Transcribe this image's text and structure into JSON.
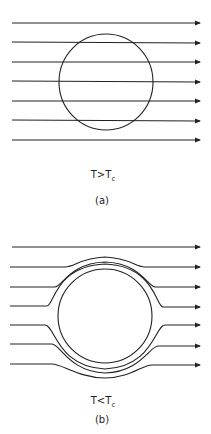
{
  "panel_a": {
    "condition_main": "T>T",
    "condition_sub": "c",
    "caption": "(a)",
    "description": "Uniform field lines passing straight through the sphere"
  },
  "panel_b": {
    "condition_main": "T<T",
    "condition_sub": "c",
    "caption": "(b)",
    "description": "Field lines expelled from the sphere (Meissner effect)"
  },
  "colors": {
    "line": "#222222",
    "background": "#ffffff"
  }
}
